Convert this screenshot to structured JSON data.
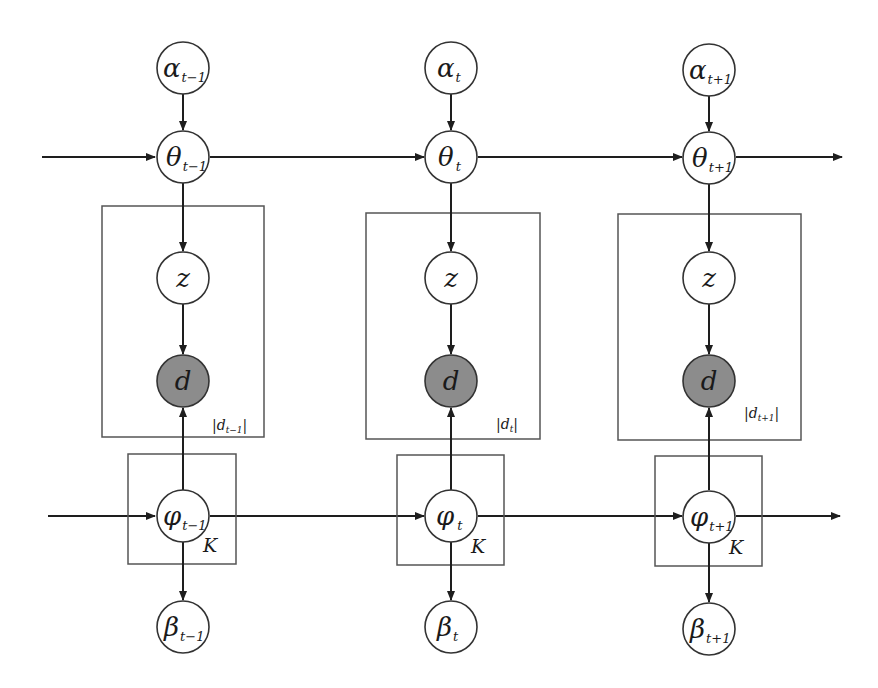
{
  "diagram": {
    "type": "graphical-model",
    "colors": {
      "background": "#ffffff",
      "stroke": "#2a2a2a",
      "observed_fill": "#8c8c8c",
      "latent_fill": "#ffffff",
      "plate_stroke": "#555555"
    },
    "time_slices": [
      {
        "id": "t-1",
        "alpha": {
          "symbol": "α",
          "sub": "t−1"
        },
        "theta": {
          "symbol": "θ",
          "sub": "t−1"
        },
        "z": {
          "symbol": "z"
        },
        "d": {
          "symbol": "d",
          "observed": true
        },
        "doc_plate_label": {
          "pre": "|d",
          "sub": "t−1",
          "post": "|"
        },
        "phi": {
          "symbol": "φ",
          "sub": "t−1"
        },
        "topic_plate_label": "K",
        "beta": {
          "symbol": "β",
          "sub": "t−1"
        }
      },
      {
        "id": "t",
        "alpha": {
          "symbol": "α",
          "sub": "t"
        },
        "theta": {
          "symbol": "θ",
          "sub": "t"
        },
        "z": {
          "symbol": "z"
        },
        "d": {
          "symbol": "d",
          "observed": true
        },
        "doc_plate_label": {
          "pre": "|d",
          "sub": "t",
          "post": "|"
        },
        "phi": {
          "symbol": "φ",
          "sub": "t"
        },
        "topic_plate_label": "K",
        "beta": {
          "symbol": "β",
          "sub": "t"
        }
      },
      {
        "id": "t+1",
        "alpha": {
          "symbol": "α",
          "sub": "t+1"
        },
        "theta": {
          "symbol": "θ",
          "sub": "t+1"
        },
        "z": {
          "symbol": "z"
        },
        "d": {
          "symbol": "d",
          "observed": true
        },
        "doc_plate_label": {
          "pre": "|d",
          "sub": "t+1",
          "post": "|"
        },
        "phi": {
          "symbol": "φ",
          "sub": "t+1"
        },
        "topic_plate_label": "K",
        "beta": {
          "symbol": "β",
          "sub": "t+1"
        }
      }
    ],
    "edges": [
      "alpha_t -> theta_t",
      "theta_t -> z_t",
      "z_t -> d_t",
      "phi_t -> d_t",
      "phi_t -> beta_t",
      "theta_{t-1} -> theta_t",
      "phi_{t-1} -> phi_t"
    ]
  }
}
